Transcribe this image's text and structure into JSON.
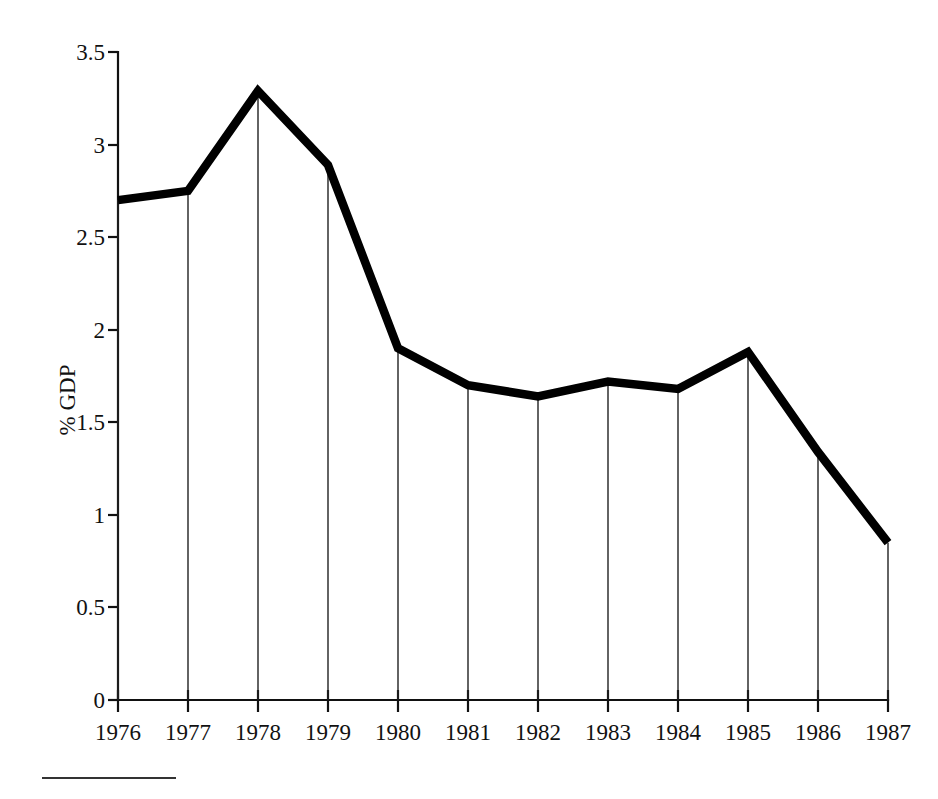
{
  "chart_data": {
    "type": "line",
    "title": "",
    "subtitle": "",
    "xlabel": "",
    "ylabel": "% GDP",
    "categories": [
      "1976",
      "1977",
      "1978",
      "1979",
      "1980",
      "1981",
      "1982",
      "1983",
      "1984",
      "1985",
      "1986",
      "1987"
    ],
    "x": [
      1976,
      1977,
      1978,
      1979,
      1980,
      1981,
      1982,
      1983,
      1984,
      1985,
      1986,
      1987
    ],
    "values": [
      2.7,
      2.75,
      3.29,
      2.89,
      1.9,
      1.7,
      1.64,
      1.72,
      1.68,
      1.88,
      1.34,
      0.85
    ],
    "series": [
      {
        "name": "% GDP",
        "values": [
          2.7,
          2.75,
          3.29,
          2.89,
          1.9,
          1.7,
          1.64,
          1.72,
          1.68,
          1.88,
          1.34,
          0.85
        ]
      }
    ],
    "ylim": [
      0,
      3.5
    ],
    "yticks": [
      0,
      0.5,
      1,
      1.5,
      2,
      2.5,
      3,
      3.5
    ],
    "ytick_labels": [
      "0",
      "0.5",
      "1",
      "1.5",
      "2",
      "2.5",
      "3",
      "3.5"
    ],
    "xtick_labels": [
      "1976",
      "1977",
      "1978",
      "1979",
      "1980",
      "1981",
      "1982",
      "1983",
      "1984",
      "1985",
      "1986",
      "1987"
    ],
    "grid": false,
    "legend": false,
    "legend_position": "none",
    "drop_lines": true,
    "line_color": "#000000",
    "background_color": "#ffffff",
    "annotations": []
  },
  "axes": {
    "y_axis_label": "% GDP",
    "y_tick_labels": [
      "3.5",
      "3",
      "2.5",
      "2",
      "1.5",
      "1",
      "0.5",
      "0"
    ],
    "x_tick_labels": [
      "1976",
      "1977",
      "1978",
      "1979",
      "1980",
      "1981",
      "1982",
      "1983",
      "1984",
      "1985",
      "1986",
      "1987"
    ]
  },
  "footnote": {
    "rule_visible": true,
    "text": ""
  }
}
